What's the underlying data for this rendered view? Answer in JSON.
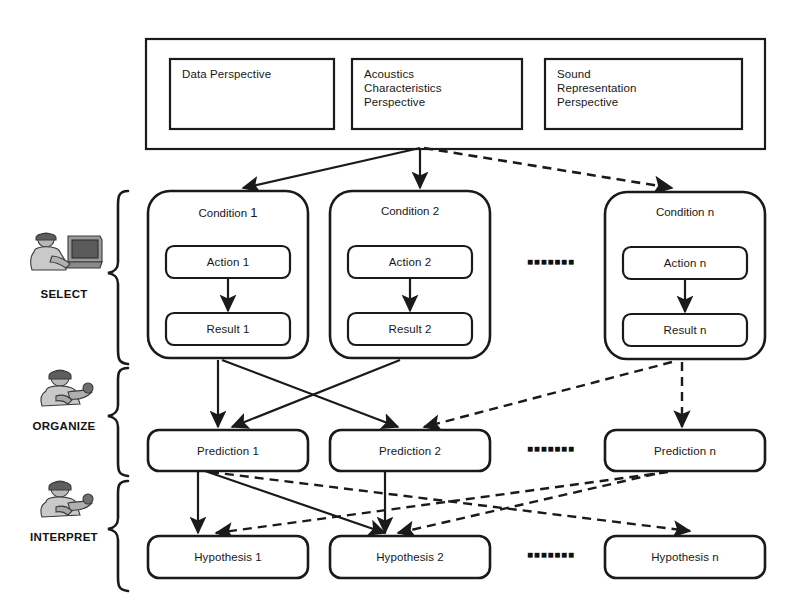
{
  "diagram": {
    "colors": {
      "line": "#1a1a1a",
      "text": "#171717",
      "background": "#ffffff"
    },
    "perspective_panel": {
      "boxes": [
        {
          "label": "Data Perspective"
        },
        {
          "label": "Acoustics\nCharacteristics\nPerspective"
        },
        {
          "label": "Sound\nRepresentation\nPerspective"
        }
      ]
    },
    "stages": [
      {
        "key": "select",
        "label": "SELECT",
        "icon": "person-at-computer-icon"
      },
      {
        "key": "organize",
        "label": "ORGANIZE",
        "icon": "person-with-tools-icon"
      },
      {
        "key": "interpret",
        "label": "INTERPRET",
        "icon": "person-with-tools-icon"
      }
    ],
    "conditions": [
      {
        "title_prefix": "Condition",
        "title_index": "1",
        "action": "Action 1",
        "result": "Result 1"
      },
      {
        "title_prefix": "Condition",
        "title_index": "2",
        "action": "Action 2",
        "result": "Result 2"
      },
      {
        "title_prefix": "Condition",
        "title_index": "n",
        "action": "Action n",
        "result": "Result n"
      }
    ],
    "predictions": [
      {
        "label": "Prediction 1"
      },
      {
        "label": "Prediction 2"
      },
      {
        "label": "Prediction n"
      }
    ],
    "hypotheses": [
      {
        "label": "Hypothesis 1"
      },
      {
        "label": "Hypothesis 2"
      },
      {
        "label": "Hypothesis n"
      }
    ],
    "ellipsis": {
      "conditions_row": "■ ■ ■ ■ ■ ■ ■",
      "predictions_row": "■ ■ ■ ■ ■ ■ ■",
      "hypotheses_row": "■ ■ ■ ■ ■ ■ ■"
    }
  }
}
